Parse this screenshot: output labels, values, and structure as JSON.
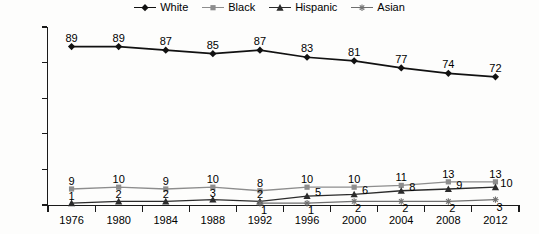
{
  "chart_data": {
    "type": "line",
    "title": "",
    "subtitle": "",
    "xlabel": "",
    "ylabel": "",
    "categories": [
      "1976",
      "1980",
      "1984",
      "1988",
      "1992",
      "1996",
      "2000",
      "2004",
      "2008",
      "2012"
    ],
    "ylim": [
      0,
      100
    ],
    "y_ticks": [
      "0",
      "20",
      "40",
      "60",
      "80",
      "100"
    ],
    "grid": false,
    "legend_position": "top-center",
    "data_labels": true,
    "series": [
      {
        "name": "White",
        "marker": "diamond",
        "color": "#111111",
        "values": [
          89,
          89,
          87,
          85,
          87,
          83,
          81,
          77,
          74,
          72
        ],
        "labels": [
          "89",
          "89",
          "87",
          "85",
          "87",
          "83",
          "81",
          "77",
          "74",
          "72"
        ]
      },
      {
        "name": "Black",
        "marker": "square",
        "color": "#8d8d8d",
        "values": [
          9,
          10,
          9,
          10,
          8,
          10,
          10,
          11,
          13,
          13
        ],
        "labels": [
          "9",
          "10",
          "9",
          "10",
          "8",
          "10",
          "10",
          "11",
          "13",
          "13"
        ]
      },
      {
        "name": "Hispanic",
        "marker": "triangle",
        "color": "#2b2b2b",
        "values": [
          1,
          2,
          2,
          3,
          2,
          5,
          6,
          8,
          9,
          10
        ],
        "labels": [
          "1",
          "2",
          "2",
          "3",
          "2",
          "5",
          "6",
          "8",
          "9",
          "10"
        ]
      },
      {
        "name": "Asian",
        "marker": "asterisk",
        "color": "#6f6f6f",
        "values": [
          null,
          null,
          null,
          null,
          1,
          1,
          2,
          2,
          2,
          3
        ],
        "labels": [
          "",
          "",
          "",
          "",
          "1",
          "1",
          "2",
          "2",
          "2",
          "3"
        ]
      }
    ]
  }
}
